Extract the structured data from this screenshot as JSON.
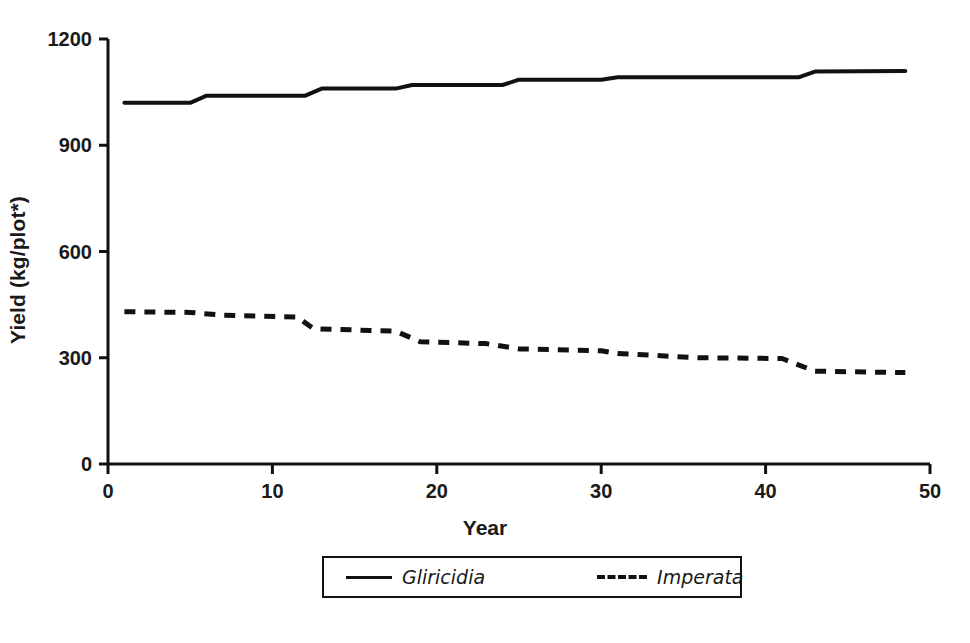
{
  "chart_data": {
    "type": "line",
    "title": "",
    "xlabel": "Year",
    "ylabel": "Yield (kg/plot*)",
    "xlim": [
      0,
      50
    ],
    "ylim": [
      0,
      1200
    ],
    "xticks": [
      0,
      10,
      20,
      30,
      40,
      50
    ],
    "yticks": [
      0,
      300,
      600,
      900,
      1200
    ],
    "xtick_labels": [
      "0",
      "10",
      "20",
      "30",
      "40",
      "50"
    ],
    "ytick_labels": [
      "0",
      "300",
      "600",
      "900",
      "1200"
    ],
    "grid": false,
    "legend_position": "below-center",
    "series": [
      {
        "name": "Gliricidia",
        "style": "solid",
        "color": "#111111",
        "x": [
          1,
          5,
          6,
          12,
          13,
          17.5,
          18.5,
          24,
          25,
          30,
          31,
          36,
          42,
          43,
          48.5
        ],
        "values": [
          1020,
          1020,
          1040,
          1040,
          1060,
          1060,
          1070,
          1070,
          1085,
          1085,
          1092,
          1092,
          1092,
          1108,
          1110
        ]
      },
      {
        "name": "Imperata",
        "style": "dashed",
        "color": "#111111",
        "x": [
          1,
          5,
          7,
          11.5,
          12.5,
          17.5,
          19,
          23,
          25,
          30,
          31,
          36,
          41,
          43,
          48.5
        ],
        "values": [
          430,
          428,
          420,
          415,
          382,
          375,
          345,
          340,
          325,
          320,
          312,
          300,
          298,
          262,
          258
        ]
      }
    ]
  },
  "axes": {
    "ylabel": "Yield (kg/plot*)",
    "xlabel": "Year"
  },
  "legend": {
    "entries": [
      {
        "label": "Gliricidia",
        "style": "solid"
      },
      {
        "label": "Imperata",
        "style": "dashed"
      }
    ]
  }
}
